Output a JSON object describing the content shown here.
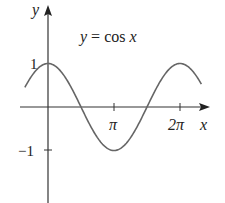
{
  "chart_data": {
    "type": "line",
    "title": "y = cos x",
    "xlabel": "x",
    "ylabel": "y",
    "x_ticks": [
      {
        "value": 3.14159,
        "label": "π"
      },
      {
        "value": 6.28319,
        "label": "2π"
      }
    ],
    "y_ticks": [
      {
        "value": 1,
        "label": "1"
      },
      {
        "value": -1,
        "label": "-1"
      }
    ],
    "xlim": [
      -1.1,
      7.3
    ],
    "ylim": [
      -1.6,
      1.2
    ],
    "series": [
      {
        "name": "y = cos x",
        "function": "cos(x)",
        "x_range": [
          -1.1,
          7.3
        ],
        "color": "#666666"
      }
    ],
    "grid": false,
    "legend": "none"
  },
  "labels": {
    "equation": "y = cos x",
    "y_axis": "y",
    "x_axis": "x",
    "tick_pi": "π",
    "tick_2pi": "2π",
    "tick_one": "1",
    "tick_neg_one": "−1"
  }
}
